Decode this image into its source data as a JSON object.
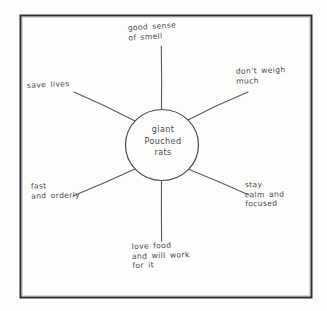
{
  "diagram": {
    "type": "word-web",
    "medium": "hand-drawn pencil on paper",
    "center": {
      "text": "giant\nPouched\nrats"
    },
    "spokes": [
      {
        "id": "top",
        "label": "good sense\nof smell",
        "direction": "up"
      },
      {
        "id": "upright",
        "label": "don't weigh\nmuch",
        "direction": "upper-right"
      },
      {
        "id": "upleft",
        "label": "save lives",
        "direction": "upper-left"
      },
      {
        "id": "lowleft",
        "label": "fast\nand orderly",
        "direction": "lower-left"
      },
      {
        "id": "lowright",
        "label": "stay\ncalm and\nfocused",
        "direction": "lower-right"
      },
      {
        "id": "bottom",
        "label": "love food\nand will work\nfor it",
        "direction": "down"
      }
    ],
    "colors": {
      "paper": "#fdfdfc",
      "ink": "#4a4a50",
      "frame": "#2e2e33"
    }
  }
}
